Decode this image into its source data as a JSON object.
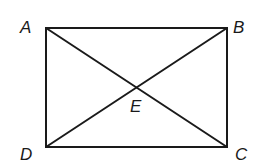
{
  "figure": {
    "type": "rectangle-with-diagonals",
    "stroke_color": "#1a1a1a",
    "background": "#ffffff",
    "vertices": {
      "A": {
        "label": "A",
        "x": 46,
        "y": 28
      },
      "B": {
        "label": "B",
        "x": 227,
        "y": 28
      },
      "C": {
        "label": "C",
        "x": 227,
        "y": 147
      },
      "D": {
        "label": "D",
        "x": 46,
        "y": 147
      }
    },
    "intersection": {
      "label": "E",
      "x": 136,
      "y": 88
    },
    "segments": [
      "AB",
      "BC",
      "CD",
      "DA",
      "AC",
      "BD"
    ]
  }
}
